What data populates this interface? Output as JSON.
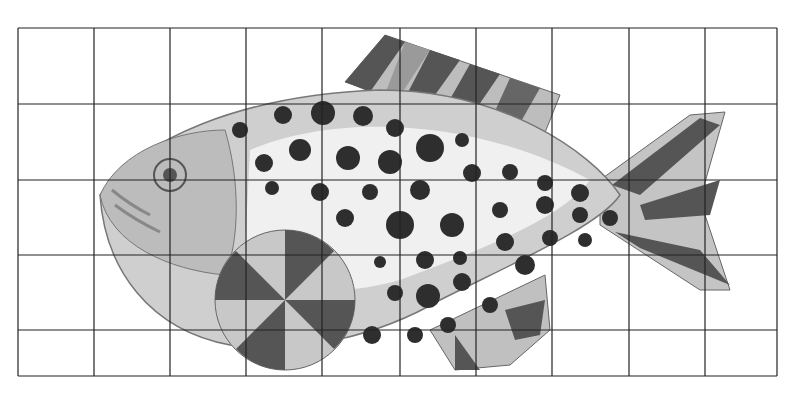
{
  "image": {
    "subject": "Watercolor fish drawing on grid",
    "description": "Grayscale watercolor illustration of a spotted fish with striped fins over a 10x5 square grid",
    "background": "#ffffff",
    "grid": {
      "columns": 10,
      "rows": 5,
      "x_lines": [
        18,
        94,
        170,
        246,
        322,
        400,
        476,
        552,
        629,
        705,
        777
      ],
      "y_lines": [
        28,
        104,
        180,
        255,
        330,
        376
      ],
      "line_color": "#222222"
    },
    "colors": {
      "body_light": "#d9d9d9",
      "body_mid": "#a8a8a8",
      "stripe_dark": "#555555",
      "spot": "#2e2e2e",
      "belly": "#f2f2f2"
    }
  }
}
